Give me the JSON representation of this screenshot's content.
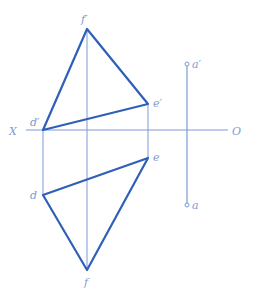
{
  "diagram": {
    "type": "orthographic-projection",
    "colors": {
      "thin_line": "#7a9ad6",
      "thick_line": "#2f5fb8",
      "label": "#7d9bd0"
    },
    "axis": {
      "left_label": "X",
      "right_label": "O"
    },
    "points": {
      "d_prime": {
        "label": "d′"
      },
      "e_prime": {
        "label": "e′"
      },
      "f_prime": {
        "label": "f′"
      },
      "d": {
        "label": "d"
      },
      "e": {
        "label": "e"
      },
      "f": {
        "label": "f"
      },
      "a_prime": {
        "label": "a′"
      },
      "a": {
        "label": "a"
      }
    }
  }
}
